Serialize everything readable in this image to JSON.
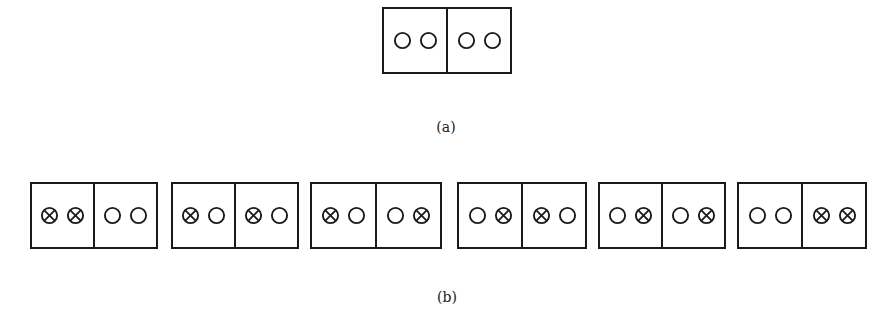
{
  "figure": {
    "part_a": {
      "label": "(a)",
      "configuration": [
        [
          "open",
          "open"
        ],
        [
          "open",
          "open"
        ]
      ]
    },
    "part_b": {
      "label": "(b)",
      "configurations": [
        [
          [
            "crossed",
            "crossed"
          ],
          [
            "open",
            "open"
          ]
        ],
        [
          [
            "crossed",
            "open"
          ],
          [
            "crossed",
            "open"
          ]
        ],
        [
          [
            "crossed",
            "open"
          ],
          [
            "open",
            "crossed"
          ]
        ],
        [
          [
            "open",
            "crossed"
          ],
          [
            "crossed",
            "open"
          ]
        ],
        [
          [
            "open",
            "crossed"
          ],
          [
            "open",
            "crossed"
          ]
        ],
        [
          [
            "open",
            "open"
          ],
          [
            "crossed",
            "crossed"
          ]
        ]
      ]
    },
    "legend": {
      "open": "open-circle-icon",
      "crossed": "crossed-circle-icon"
    },
    "colors": {
      "line": "#1a1a1a",
      "background": "#ffffff"
    }
  }
}
